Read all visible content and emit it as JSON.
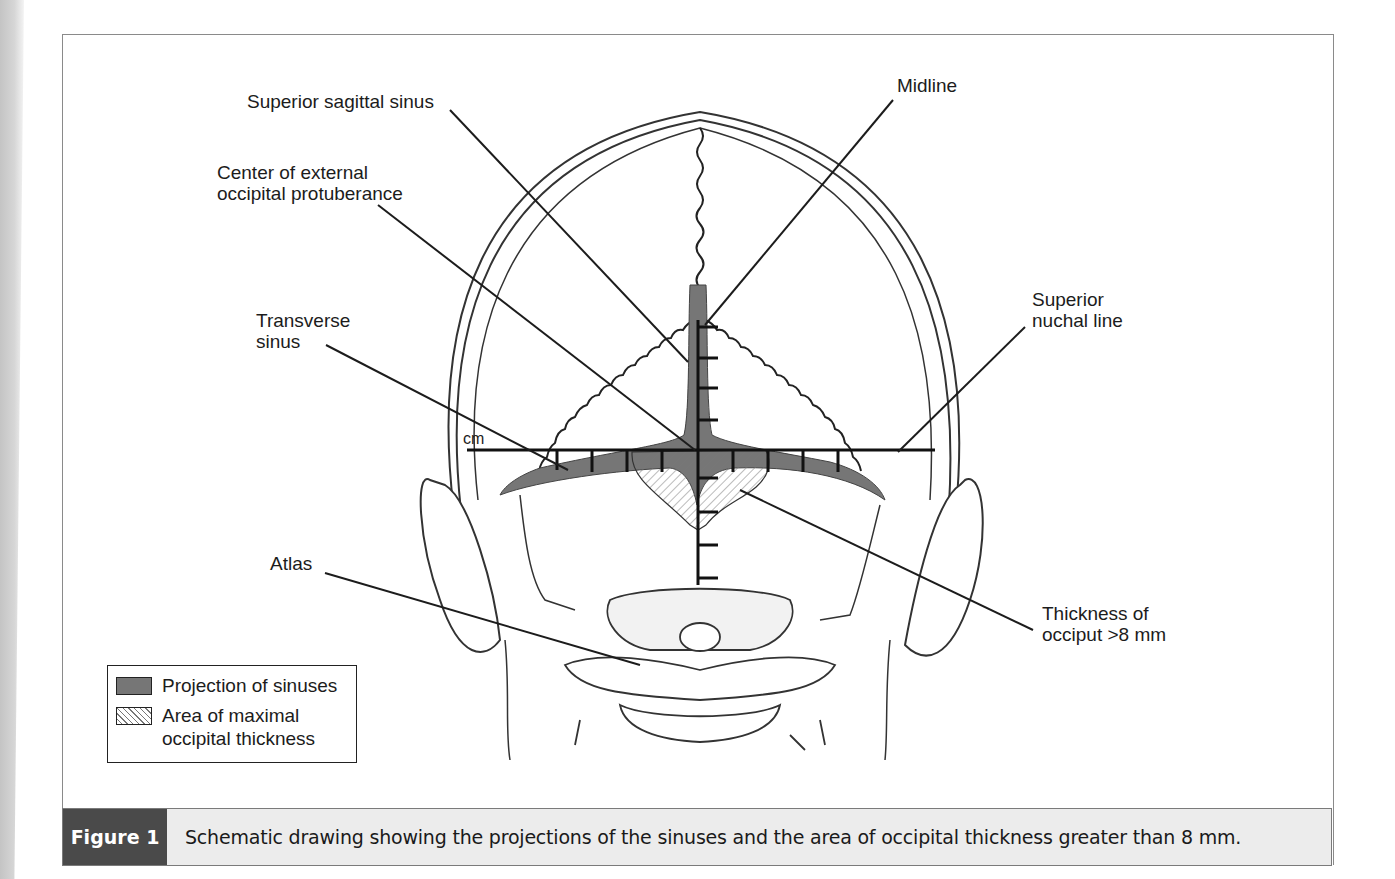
{
  "figure": {
    "labels": {
      "superior_sagittal_sinus": "Superior sagittal sinus",
      "midline": "Midline",
      "center_eop": "Center of external\noccipital protuberance",
      "superior_nuchal_line": "Superior\nnuchal line",
      "transverse_sinus": "Transverse\nsinus",
      "cm": "cm",
      "atlas": "Atlas",
      "thickness": "Thickness of\nocciput >8 mm"
    },
    "legend": {
      "items": [
        {
          "swatch": "solid-gray",
          "label": "Projection of sinuses"
        },
        {
          "swatch": "hatched",
          "label": "Area of maximal\noccipital thickness"
        }
      ]
    },
    "caption": {
      "tag": "Figure 1",
      "text": "Schematic drawing showing the projections of the sinuses and the area of occipital thickness greater than 8 mm."
    },
    "colors": {
      "sinus_fill": "#767676",
      "caption_tag_bg": "#4a4a4a",
      "caption_bg": "#ececec",
      "line": "#1c1c1c"
    }
  }
}
